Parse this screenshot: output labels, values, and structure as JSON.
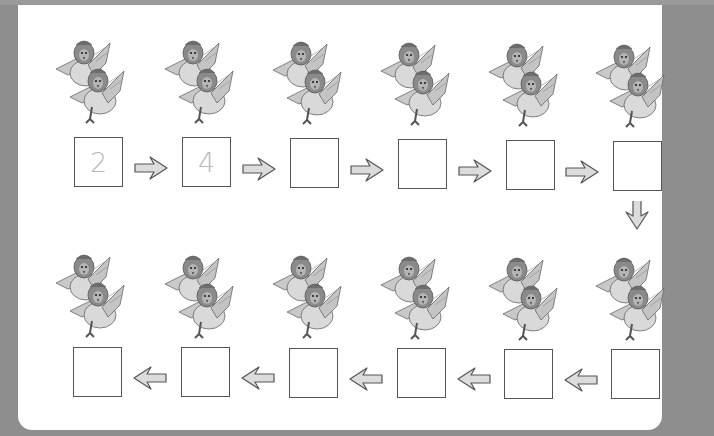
{
  "worksheet": {
    "title": "Count the chickens by twos",
    "colors": {
      "background": "#8e8e8e",
      "sheet": "#ffffff",
      "box_border": "#555555",
      "prefilled_number": "#b8b8b8",
      "arrow_fill": "#dcdcdc",
      "arrow_stroke": "#555555"
    },
    "top_row": {
      "direction": "right",
      "groups": [
        {
          "chickens": 2,
          "value": "2"
        },
        {
          "chickens": 2,
          "value": "4"
        },
        {
          "chickens": 2,
          "value": ""
        },
        {
          "chickens": 2,
          "value": ""
        },
        {
          "chickens": 2,
          "value": ""
        },
        {
          "chickens": 2,
          "value": ""
        }
      ]
    },
    "connector": {
      "direction": "down"
    },
    "bottom_row": {
      "direction": "left",
      "groups": [
        {
          "chickens": 2,
          "value": ""
        },
        {
          "chickens": 2,
          "value": ""
        },
        {
          "chickens": 2,
          "value": ""
        },
        {
          "chickens": 2,
          "value": ""
        },
        {
          "chickens": 2,
          "value": ""
        },
        {
          "chickens": 2,
          "value": ""
        }
      ]
    },
    "icons": {
      "chicken": "chicken-pair-icon",
      "arrow_right": "arrow-right-icon",
      "arrow_left": "arrow-left-icon",
      "arrow_down": "arrow-down-icon"
    }
  }
}
